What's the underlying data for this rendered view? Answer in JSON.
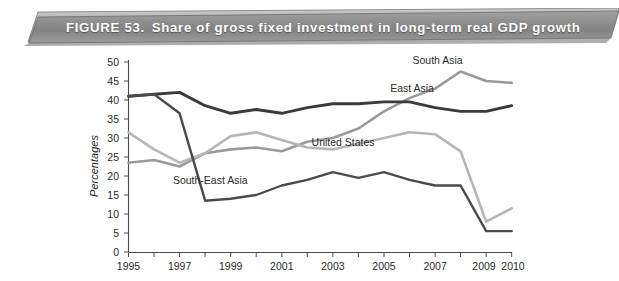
{
  "figure": {
    "number_label": "FIGURE 53.",
    "title": "Share of gross fixed investment in long-term real GDP growth",
    "banner_fill": "#8e8e8e",
    "banner_text_color": "#ffffff"
  },
  "chart_data": {
    "type": "line",
    "title": "Share of gross fixed investment in long-term real GDP growth",
    "xlabel": "",
    "ylabel": "Percentages",
    "xlim": [
      1995,
      2010
    ],
    "ylim": [
      0,
      50
    ],
    "y_ticks": [
      0,
      5,
      10,
      15,
      20,
      25,
      30,
      35,
      40,
      45,
      50
    ],
    "x_ticks": [
      1995,
      1996,
      1997,
      1998,
      1999,
      2000,
      2001,
      2002,
      2003,
      2004,
      2005,
      2006,
      2007,
      2008,
      2009,
      2010
    ],
    "x_tick_labels": [
      "1995",
      "",
      "1997",
      "",
      "1999",
      "",
      "2001",
      "",
      "2003",
      "",
      "2005",
      "",
      "2007",
      "",
      "2009",
      "2010"
    ],
    "grid": false,
    "legend": "inline-annotations",
    "x": [
      1995,
      1996,
      1997,
      1998,
      1999,
      2000,
      2001,
      2002,
      2003,
      2004,
      2005,
      2006,
      2007,
      2008,
      2009,
      2010
    ],
    "series": [
      {
        "name": "South Asia",
        "color": "#9a9a9a",
        "label_x": 2007.1,
        "label_y": 49.5,
        "values": [
          23.5,
          24.2,
          22.5,
          26.0,
          27.0,
          27.5,
          26.5,
          29.0,
          30.0,
          32.5,
          37.0,
          40.5,
          43.0,
          47.5,
          45.0,
          44.5
        ]
      },
      {
        "name": "East Asia",
        "color": "#3a3a3a",
        "label_x": 2006.1,
        "label_y": 42.0,
        "values": [
          41.0,
          41.5,
          42.0,
          38.5,
          36.5,
          37.5,
          36.5,
          38.0,
          39.0,
          39.0,
          39.5,
          39.5,
          38.0,
          37.0,
          37.0,
          38.5
        ]
      },
      {
        "name": "United States",
        "color": "#b6b6b6",
        "label_x": 2003.4,
        "label_y": 28.0,
        "values": [
          31.5,
          27.0,
          23.5,
          26.0,
          30.5,
          31.5,
          29.5,
          27.5,
          27.0,
          28.5,
          30.0,
          31.5,
          31.0,
          26.5,
          8.0,
          11.5
        ]
      },
      {
        "name": "South-East Asia",
        "color": "#4b4b4b",
        "label_x": 1998.2,
        "label_y": 18.0,
        "values": [
          41.0,
          41.5,
          36.5,
          13.5,
          14.0,
          15.0,
          17.5,
          19.0,
          21.0,
          19.5,
          21.0,
          19.0,
          17.5,
          17.5,
          5.5,
          5.5
        ]
      }
    ]
  }
}
